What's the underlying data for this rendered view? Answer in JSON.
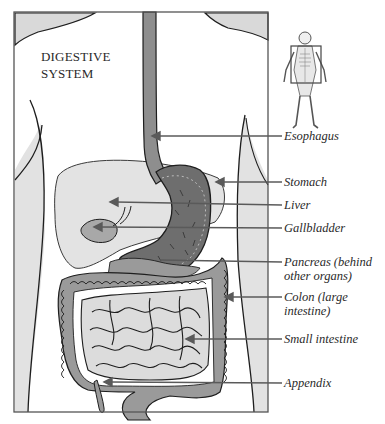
{
  "diagram": {
    "title_lines": [
      "DIGESTIVE",
      "SYSTEM"
    ],
    "labels": [
      {
        "id": "esophagus",
        "lines": [
          "Esophagus"
        ],
        "y": 136
      },
      {
        "id": "stomach",
        "lines": [
          "Stomach"
        ],
        "y": 182
      },
      {
        "id": "liver",
        "lines": [
          "Liver"
        ],
        "y": 205
      },
      {
        "id": "gallbladder",
        "lines": [
          "Gallbladder"
        ],
        "y": 228
      },
      {
        "id": "pancreas",
        "lines": [
          "Pancreas (behind",
          "other organs)"
        ],
        "y": 262
      },
      {
        "id": "colon",
        "lines": [
          "Colon (large",
          "intestine)"
        ],
        "y": 297
      },
      {
        "id": "small-intestine",
        "lines": [
          "Small intestine"
        ],
        "y": 339
      },
      {
        "id": "appendix",
        "lines": [
          "Appendix"
        ],
        "y": 383
      }
    ],
    "inset": {
      "description": "skeleton figure with highlighted torso region"
    },
    "colors": {
      "frame": "#555555",
      "skin_shade": "#d9d9d9",
      "organ_light": "#e0e0e0",
      "organ_mid": "#9a9a9a",
      "organ_dark": "#6e6e6e",
      "outline": "#1e1e1e",
      "leader": "#5a5a5a"
    }
  }
}
